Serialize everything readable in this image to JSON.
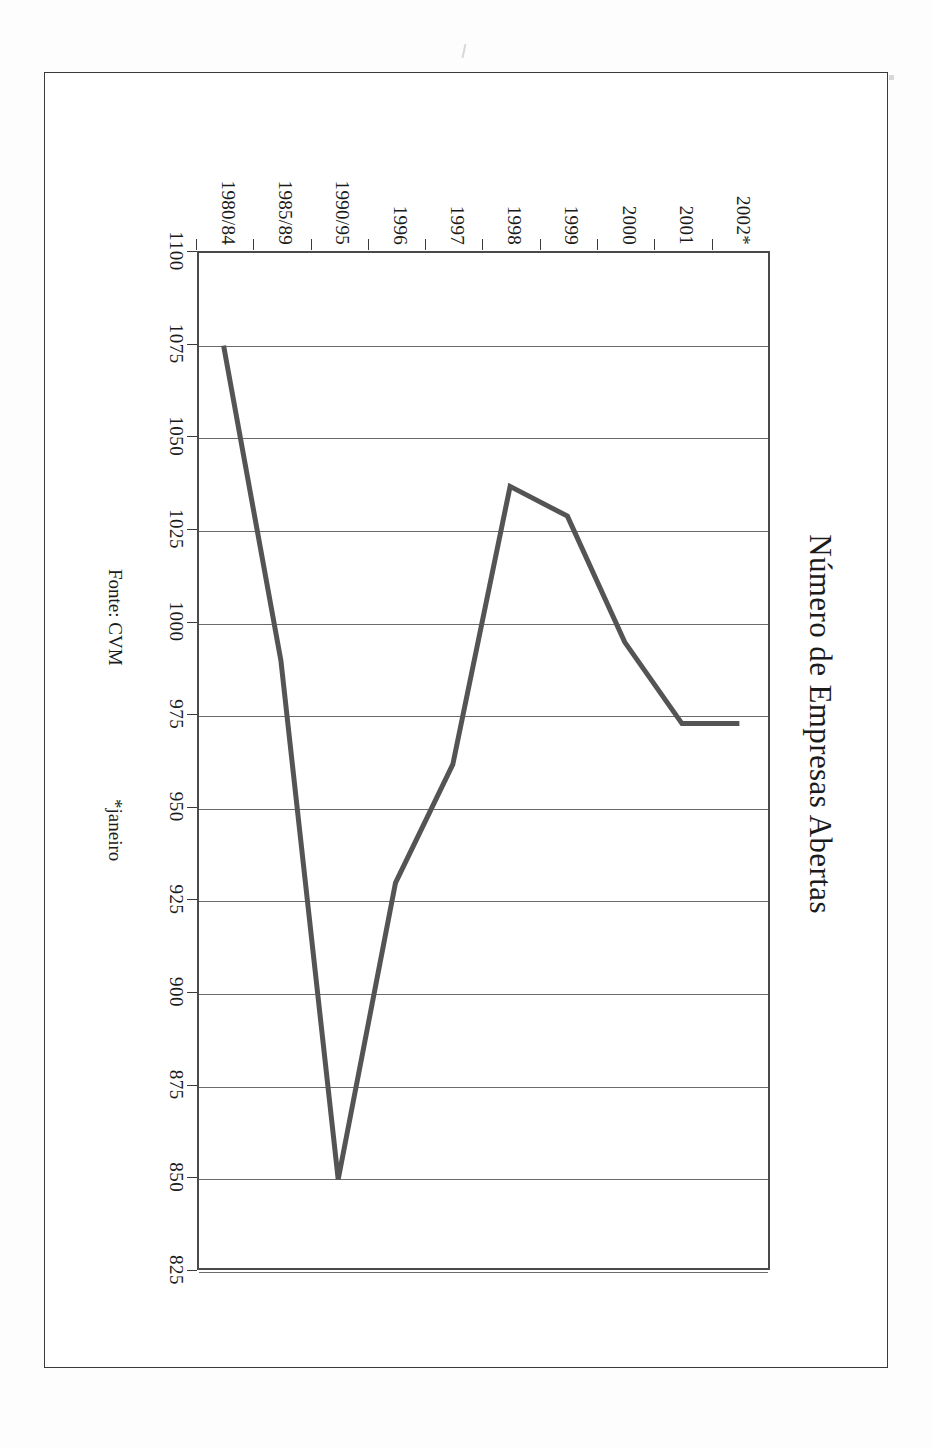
{
  "document": {
    "frame_present": true,
    "background_color": "#ffffff"
  },
  "chart_data": {
    "type": "line",
    "title": "Número de Empresas Abertas",
    "xlabel": "",
    "ylabel": "",
    "categories": [
      "1980/84",
      "1985/89",
      "1990/95",
      "1996",
      "1997",
      "1998",
      "1999",
      "2000",
      "2001",
      "2002*"
    ],
    "values": [
      1075,
      990,
      850,
      930,
      962,
      1037,
      1029,
      995,
      973,
      973
    ],
    "series": [
      {
        "name": "Número de Empresas Abertas",
        "values": [
          1075,
          990,
          850,
          930,
          962,
          1037,
          1029,
          995,
          973,
          973
        ]
      }
    ],
    "ytick_labels": [
      "1100",
      "1075",
      "1050",
      "1025",
      "1000",
      "975",
      "950",
      "925",
      "900",
      "875",
      "850",
      "825"
    ],
    "ytick_values": [
      1100,
      1075,
      1050,
      1025,
      1000,
      975,
      950,
      925,
      900,
      875,
      850,
      825
    ],
    "ylim": [
      825,
      1100
    ],
    "grid": "vertical",
    "legend": "none",
    "line_color": "#545454",
    "axis_color": "#4a4a4a",
    "orientation": "rotated-90",
    "source": "Fonte: CVM",
    "footnote": "*janeiro"
  },
  "notes": {
    "source_label": "Fonte: CVM",
    "asterisk_label": "*janeiro"
  }
}
